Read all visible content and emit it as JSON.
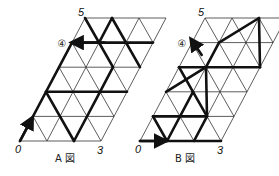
{
  "lattice": {
    "cols": 3,
    "rows": 5,
    "unit_x": 27,
    "step_x": 13,
    "step_y": -24.6
  },
  "figures": [
    {
      "id": "A",
      "caption": "A 図",
      "origin": [
        20,
        141
      ],
      "labels": {
        "start": "0",
        "end_bottom": "3",
        "top": "5",
        "marker": "④"
      },
      "marker_row": 4,
      "bold_segments": [
        [
          [
            0,
            0
          ],
          [
            0,
            4
          ]
        ],
        [
          [
            0,
            4
          ],
          [
            3,
            4
          ]
        ],
        [
          [
            0,
            2
          ],
          [
            3,
            2
          ]
        ],
        [
          [
            0,
            5
          ],
          [
            2,
            3
          ]
        ],
        [
          [
            1,
            4
          ],
          [
            1,
            5
          ]
        ],
        [
          [
            1,
            5
          ],
          [
            3,
            3
          ]
        ],
        [
          [
            2,
            3
          ],
          [
            2,
            2
          ]
        ],
        [
          [
            0,
            2
          ],
          [
            2,
            0
          ]
        ],
        [
          [
            2,
            0
          ],
          [
            2,
            2
          ]
        ]
      ],
      "start_arrow": {
        "from": [
          0,
          0
        ],
        "to": [
          0,
          0.8
        ]
      },
      "end_arrow": {
        "from": [
          1.2,
          4
        ],
        "to": [
          0.15,
          4
        ]
      }
    },
    {
      "id": "B",
      "caption": "B 図",
      "origin": [
        140,
        141
      ],
      "labels": {
        "start": "0",
        "end_bottom": "3",
        "top": "5",
        "marker": "④"
      },
      "marker_row": 4,
      "bold_segments": [
        [
          [
            0,
            0
          ],
          [
            3,
            0
          ]
        ],
        [
          [
            0,
            1
          ],
          [
            2,
            1
          ]
        ],
        [
          [
            0,
            3
          ],
          [
            3,
            3
          ]
        ],
        [
          [
            0,
            1
          ],
          [
            1,
            0
          ]
        ],
        [
          [
            1,
            0
          ],
          [
            1,
            2
          ]
        ],
        [
          [
            1,
            2
          ],
          [
            2,
            1
          ]
        ],
        [
          [
            2,
            1
          ],
          [
            2,
            0
          ]
        ],
        [
          [
            0,
            2
          ],
          [
            1,
            3
          ]
        ],
        [
          [
            1,
            3
          ],
          [
            1,
            4
          ]
        ],
        [
          [
            1,
            4
          ],
          [
            2,
            5
          ]
        ],
        [
          [
            2,
            5
          ],
          [
            3,
            3
          ]
        ],
        [
          [
            0,
            3
          ],
          [
            1,
            2
          ]
        ],
        [
          [
            1,
            3
          ],
          [
            2,
            1
          ]
        ]
      ],
      "start_arrow": {
        "from": [
          0,
          0
        ],
        "to": [
          0.8,
          0
        ]
      },
      "end_arrow": {
        "from": [
          0.6,
          3.5
        ],
        "to": [
          0.05,
          4
        ]
      }
    }
  ]
}
